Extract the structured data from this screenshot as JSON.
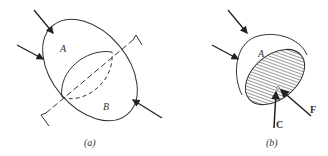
{
  "panel_a": {
    "caption": "(a)",
    "label_A": "A",
    "label_B": "B"
  },
  "panel_b": {
    "caption": "(b)",
    "label_A": "A",
    "label_C": "C",
    "label_F": "F"
  },
  "colors": {
    "stroke": "#333333",
    "hatch": "#666666"
  }
}
